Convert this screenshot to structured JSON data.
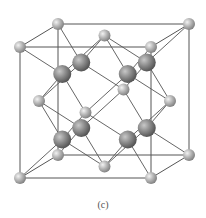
{
  "caption": "(c)",
  "structure": {
    "type": "fluorite-like cubic unit cell",
    "projection": {
      "origin": [
        20,
        47
      ],
      "x_axis": [
        131,
        0
      ],
      "y_axis": [
        0,
        131
      ],
      "z_axis": [
        38,
        -23
      ]
    },
    "small_atoms": [
      [
        0,
        0,
        0
      ],
      [
        1,
        0,
        0
      ],
      [
        0,
        1,
        0
      ],
      [
        1,
        1,
        0
      ],
      [
        0,
        0,
        1
      ],
      [
        1,
        0,
        1
      ],
      [
        0,
        1,
        1
      ],
      [
        1,
        1,
        1
      ],
      [
        0.5,
        0,
        0.5
      ],
      [
        0.5,
        1,
        0.5
      ],
      [
        0,
        0.5,
        0.5
      ],
      [
        1,
        0.5,
        0.5
      ],
      [
        0.5,
        0.5,
        0
      ],
      [
        0.5,
        0.5,
        1
      ]
    ],
    "large_atoms": [
      [
        0.25,
        0.25,
        0.25
      ],
      [
        0.75,
        0.25,
        0.25
      ],
      [
        0.25,
        0.75,
        0.25
      ],
      [
        0.75,
        0.75,
        0.25
      ],
      [
        0.25,
        0.25,
        0.75
      ],
      [
        0.75,
        0.25,
        0.75
      ],
      [
        0.25,
        0.75,
        0.75
      ],
      [
        0.75,
        0.75,
        0.75
      ]
    ],
    "small_radius": 6,
    "large_radius": 9,
    "colors": {
      "edge": "#555555",
      "small_light": "#e2e2e2",
      "small_dark": "#7d7d7d",
      "large_light": "#b8b8b8",
      "large_dark": "#4f4f4f"
    }
  }
}
